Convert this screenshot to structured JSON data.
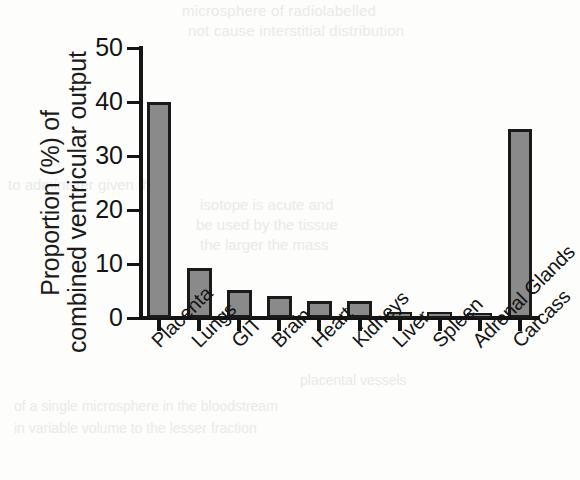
{
  "chart_data": {
    "type": "bar",
    "title": "",
    "xlabel": "",
    "ylabel": "Proportion (%) of combined ventricular output",
    "ylabel_line1": "Proportion (%) of",
    "ylabel_line2": "combined ventricular output",
    "categories": [
      "Placenta",
      "Lungs",
      "GIT",
      "Brain",
      "Heart",
      "Kidneys",
      "Liver",
      "Spleen",
      "Adrenal Glands",
      "Carcass"
    ],
    "values": [
      40.0,
      9.3,
      5.2,
      4.1,
      3.1,
      3.1,
      1.1,
      1.1,
      0.1,
      35.0
    ],
    "ylim": [
      0,
      50
    ],
    "yticks": [
      0,
      10,
      20,
      30,
      40,
      50
    ],
    "ytick_labels": [
      "0",
      "10",
      "20",
      "30",
      "40",
      "50"
    ],
    "grid": false,
    "legend": "none",
    "bar_fill_color": "#8a8a8a",
    "bar_edge_color": "#1a1a1a",
    "axis_color": "#141414",
    "background_color": "#fdfdfb"
  },
  "bleed_text": {
    "line1": "microsphere of radiolabelled",
    "line2": "not cause interstitial distribution",
    "line3": "to administer given the",
    "line4": "isotope is acute and",
    "line5": "be used by the tissue",
    "line6": "the larger the mass",
    "line7": "of a single microsphere in the bloodstream",
    "line8": "in variable volume to the lesser fraction",
    "line9": "placental vessels"
  }
}
